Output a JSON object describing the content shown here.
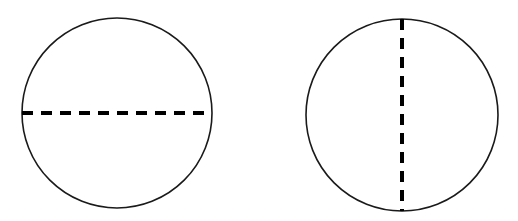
{
  "diagram": {
    "background": "#ffffff",
    "stroke_color": "#1a1a1a",
    "dash_color": "#000000",
    "figures": [
      {
        "id": "left-circle",
        "shape": "circle",
        "cx": 117,
        "cy": 113,
        "r": 95,
        "diameter_line": {
          "orientation": "horizontal",
          "style": "dashed",
          "x1": 22,
          "y1": 113,
          "x2": 212,
          "y2": 113
        }
      },
      {
        "id": "right-circle",
        "shape": "circle",
        "cx": 402,
        "cy": 115,
        "r": 96,
        "diameter_line": {
          "orientation": "vertical",
          "style": "dashed",
          "x1": 402,
          "y1": 19,
          "x2": 402,
          "y2": 211
        }
      }
    ]
  }
}
